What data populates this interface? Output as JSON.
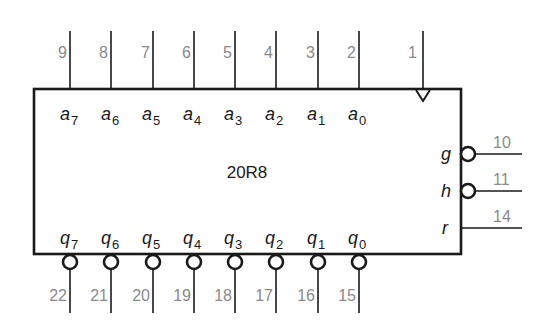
{
  "chip": {
    "name": "20R8",
    "box": {
      "left": 34,
      "top": 89,
      "right": 461,
      "bottom": 254
    }
  },
  "top_pins": [
    {
      "pin": "9",
      "signal": "a",
      "index": "7",
      "x": 70
    },
    {
      "pin": "8",
      "signal": "a",
      "index": "6",
      "x": 111
    },
    {
      "pin": "7",
      "signal": "a",
      "index": "5",
      "x": 153
    },
    {
      "pin": "6",
      "signal": "a",
      "index": "4",
      "x": 194
    },
    {
      "pin": "5",
      "signal": "a",
      "index": "3",
      "x": 235
    },
    {
      "pin": "4",
      "signal": "a",
      "index": "2",
      "x": 276
    },
    {
      "pin": "3",
      "signal": "a",
      "index": "1",
      "x": 318
    },
    {
      "pin": "2",
      "signal": "a",
      "index": "0",
      "x": 359
    }
  ],
  "clock_pin": {
    "pin": "1",
    "x": 423,
    "type": "clock"
  },
  "right_pins": [
    {
      "pin": "10",
      "signal": "g",
      "y": 154,
      "inverted": true
    },
    {
      "pin": "11",
      "signal": "h",
      "y": 191,
      "inverted": true
    },
    {
      "pin": "14",
      "signal": "r",
      "y": 228,
      "inverted": false
    }
  ],
  "bottom_pins": [
    {
      "pin": "22",
      "signal": "q",
      "index": "7",
      "x": 70
    },
    {
      "pin": "21",
      "signal": "q",
      "index": "6",
      "x": 111
    },
    {
      "pin": "20",
      "signal": "q",
      "index": "5",
      "x": 153
    },
    {
      "pin": "19",
      "signal": "q",
      "index": "4",
      "x": 194
    },
    {
      "pin": "18",
      "signal": "q",
      "index": "3",
      "x": 235
    },
    {
      "pin": "17",
      "signal": "q",
      "index": "2",
      "x": 276
    },
    {
      "pin": "16",
      "signal": "q",
      "index": "1",
      "x": 318
    },
    {
      "pin": "15",
      "signal": "q",
      "index": "0",
      "x": 359
    }
  ],
  "colors": {
    "line": "#1a1a1a",
    "pin_number": "#8a8a8a",
    "background": "#ffffff"
  }
}
